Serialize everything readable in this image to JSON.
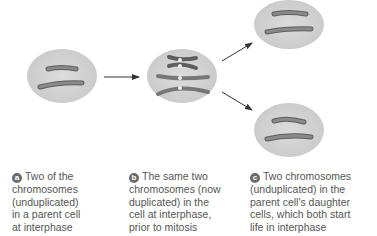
{
  "figure": {
    "stages": [
      {
        "letter": "a",
        "lines": [
          "Two of the",
          "chromosomes",
          "(unduplicated)",
          "in a parent cell",
          "at interphase"
        ]
      },
      {
        "letter": "b",
        "lines": [
          "The same two",
          "chromosomes (now",
          "duplicated) in the",
          "cell at interphase,",
          "prior to mitosis"
        ]
      },
      {
        "letter": "c",
        "lines": [
          "Two chromosomes",
          "(unduplicated) in the",
          "parent cell's daughter",
          "cells, which both start",
          "life in interphase"
        ]
      }
    ],
    "colors": {
      "cell": "#d4d4d4",
      "chromosome": "#7a7a7a",
      "chromosome_edge": "#5e5e5e",
      "arrow": "#333333",
      "badge": "#6b6b6b",
      "text": "#555555"
    }
  }
}
